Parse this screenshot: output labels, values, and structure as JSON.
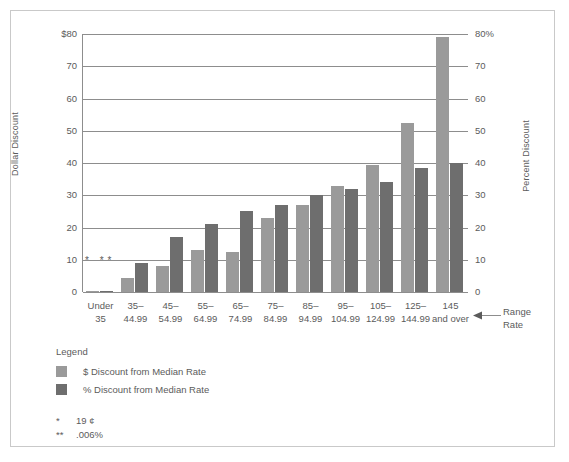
{
  "chart_data": {
    "type": "bar",
    "title": "",
    "subtitle": "",
    "xlabel": "Range Rate",
    "ylabel": "Dollar Discount",
    "y2label": "Percent Discount",
    "categories": [
      "Under 35",
      "35–44.99",
      "45–54.99",
      "55–64.99",
      "65–74.99",
      "75–84.99",
      "85–94.99",
      "95–104.99",
      "105–124.99",
      "125–144.99",
      "145 and over"
    ],
    "categories_lines": [
      [
        "Under",
        "35"
      ],
      [
        "35–",
        "44.99"
      ],
      [
        "45–",
        "54.99"
      ],
      [
        "55–",
        "64.99"
      ],
      [
        "65–",
        "74.99"
      ],
      [
        "75–",
        "84.99"
      ],
      [
        "85–",
        "94.99"
      ],
      [
        "95–",
        "104.99"
      ],
      [
        "105–",
        "124.99"
      ],
      [
        "125–",
        "144.99"
      ],
      [
        "145",
        "and over"
      ]
    ],
    "series": [
      {
        "name": "$ Discount from Median Rate",
        "color": "#9a9a9a",
        "axis": "left",
        "values": [
          0.19,
          4.5,
          8,
          13,
          12.5,
          23,
          27,
          33,
          39.5,
          52.5,
          79
        ]
      },
      {
        "name": "% Discount from Median Rate",
        "color": "#6e6e6e",
        "axis": "right",
        "values": [
          0.006,
          9,
          17,
          21,
          25,
          27,
          30,
          32,
          34,
          38.5,
          40
        ]
      }
    ],
    "ylim": [
      0,
      80
    ],
    "y2lim": [
      0,
      80
    ],
    "yticks": [
      "$80",
      "70",
      "60",
      "50",
      "40",
      "30",
      "20",
      "10",
      "0"
    ],
    "ytick_values": [
      80,
      70,
      60,
      50,
      40,
      30,
      20,
      10,
      0
    ],
    "y2ticks": [
      "80%",
      "70",
      "60",
      "50",
      "40",
      "30",
      "20",
      "10",
      "0"
    ],
    "y2tick_values": [
      80,
      70,
      60,
      50,
      40,
      30,
      20,
      10,
      0
    ],
    "grid": true,
    "legend_position": "below-left",
    "annotations": [
      {
        "category": "Under 35",
        "mark": "*  **"
      }
    ]
  },
  "legend": {
    "title": "Legend",
    "items": [
      {
        "label": "$ Discount from Median Rate",
        "color": "#9a9a9a"
      },
      {
        "label": "% Discount from Median Rate",
        "color": "#6e6e6e"
      }
    ]
  },
  "footnotes": [
    {
      "mark": "*",
      "text": "19 ¢"
    },
    {
      "mark": "**",
      "text": ".006%"
    }
  ],
  "range_rate": {
    "line1": "Range",
    "line2": "Rate"
  },
  "colors": {
    "dollar_bar": "#9a9a9a",
    "percent_bar": "#6e6e6e",
    "gridline": "#8d8d8d",
    "text": "#5b5b5b",
    "border": "#c9c9c9"
  }
}
